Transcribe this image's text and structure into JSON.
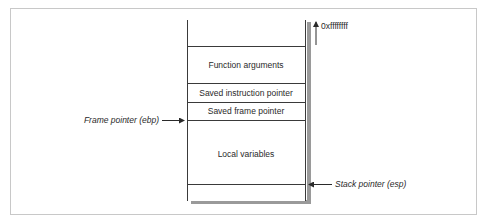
{
  "diagram": {
    "top_address": "0xffffffff",
    "sections": [
      {
        "label": "",
        "name": "stack-top-empty"
      },
      {
        "label": "Function arguments",
        "name": "function-arguments"
      },
      {
        "label": "Saved instruction pointer",
        "name": "saved-instruction-pointer"
      },
      {
        "label": "Saved frame pointer",
        "name": "saved-frame-pointer"
      },
      {
        "label": "Local variables",
        "name": "local-variables"
      },
      {
        "label": "",
        "name": "stack-bottom-empty"
      }
    ],
    "pointers": {
      "frame_pointer": "Frame pointer (ebp)",
      "stack_pointer": "Stack pointer (esp)"
    },
    "colors": {
      "line": "#3a3a3a",
      "shadow": "#9a9a9a",
      "border": "#c8c8c8"
    }
  }
}
